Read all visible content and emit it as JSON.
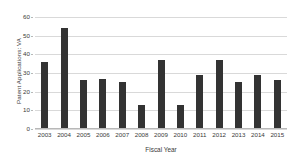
{
  "chart_data": {
    "type": "bar",
    "title": "",
    "xlabel": "Fiscal Year",
    "ylabel": "Patent Applications: VA",
    "categories": [
      "2003",
      "2004",
      "2005",
      "2006",
      "2007",
      "2008",
      "2009",
      "2010",
      "2011",
      "2012",
      "2013",
      "2014",
      "2015"
    ],
    "values": [
      36,
      54,
      26,
      27,
      25,
      13,
      37,
      13,
      29,
      37,
      25,
      29,
      26
    ],
    "ylim": [
      0,
      60
    ],
    "ytick_labels": [
      "0",
      "10",
      "20",
      "30",
      "40",
      "50",
      "60"
    ],
    "ytick_values": [
      0,
      10,
      20,
      30,
      40,
      50,
      60
    ],
    "grid": "horizontal",
    "legend": "none",
    "bar_color": "#333333",
    "gridline_color": "#d9d9d9",
    "axis_color": "#b8b8b8",
    "background_color": "#ffffff"
  }
}
